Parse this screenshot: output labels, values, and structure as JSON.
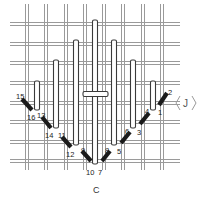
{
  "figure": {
    "caption": "C",
    "pointer_label": "J",
    "colors": {
      "background": "#ffffff",
      "canvas_thread": "#9a9a9a",
      "bar_outline": "#3a3a3a",
      "stitch": "#1a1a1a"
    },
    "grid": {
      "vertical_x": [
        27,
        46,
        66,
        85,
        104,
        123,
        143,
        162
      ],
      "horizontal_y": [
        24,
        44,
        63,
        83,
        103,
        122,
        142,
        161
      ]
    },
    "vertical_bars": [
      {
        "x": 37,
        "y1": 81,
        "y2": 110
      },
      {
        "x": 56,
        "y1": 60,
        "y2": 128
      },
      {
        "x": 76,
        "y1": 40,
        "y2": 145
      },
      {
        "x": 95,
        "y1": 20,
        "y2": 164
      },
      {
        "x": 114,
        "y1": 40,
        "y2": 145
      },
      {
        "x": 133,
        "y1": 60,
        "y2": 128
      },
      {
        "x": 153,
        "y1": 81,
        "y2": 110
      }
    ],
    "horizontal_bar": {
      "x1": 83,
      "x2": 108,
      "y": 94
    },
    "stitches": [
      {
        "from": "1",
        "to": "2",
        "x1": 159,
        "y1": 105,
        "x2": 167,
        "y2": 93
      },
      {
        "from": "3",
        "to": "4",
        "x1": 140,
        "y1": 124,
        "x2": 149,
        "y2": 113
      },
      {
        "from": "5",
        "to": "6",
        "x1": 121,
        "y1": 143,
        "x2": 130,
        "y2": 132
      },
      {
        "from": "7",
        "to": "8",
        "x1": 102,
        "y1": 161,
        "x2": 110,
        "y2": 151
      },
      {
        "from": "9",
        "to": "10",
        "x1": 82,
        "y1": 151,
        "x2": 91,
        "y2": 161
      },
      {
        "from": "11",
        "to": "12",
        "x1": 62,
        "y1": 137,
        "x2": 71,
        "y2": 147
      },
      {
        "from": "13",
        "to": "14",
        "x1": 42,
        "y1": 117,
        "x2": 51,
        "y2": 128
      },
      {
        "from": "15",
        "to": "16",
        "x1": 22,
        "y1": 99,
        "x2": 32,
        "y2": 110
      }
    ],
    "labels": [
      {
        "text": "1",
        "x": 158,
        "y": 115
      },
      {
        "text": "2",
        "x": 168,
        "y": 95
      },
      {
        "text": "3",
        "x": 137,
        "y": 135
      },
      {
        "text": "4",
        "x": 145,
        "y": 114
      },
      {
        "text": "5",
        "x": 117,
        "y": 154
      },
      {
        "text": "6",
        "x": 125,
        "y": 134
      },
      {
        "text": "7",
        "x": 98,
        "y": 175
      },
      {
        "text": "8",
        "x": 105,
        "y": 153
      },
      {
        "text": "9",
        "x": 81,
        "y": 153
      },
      {
        "text": "10",
        "x": 86,
        "y": 175
      },
      {
        "text": "11",
        "x": 58,
        "y": 138
      },
      {
        "text": "12",
        "x": 66,
        "y": 157
      },
      {
        "text": "13",
        "x": 37,
        "y": 118
      },
      {
        "text": "14",
        "x": 45,
        "y": 138
      },
      {
        "text": "15",
        "x": 16,
        "y": 99
      },
      {
        "text": "16",
        "x": 27,
        "y": 120
      }
    ]
  }
}
